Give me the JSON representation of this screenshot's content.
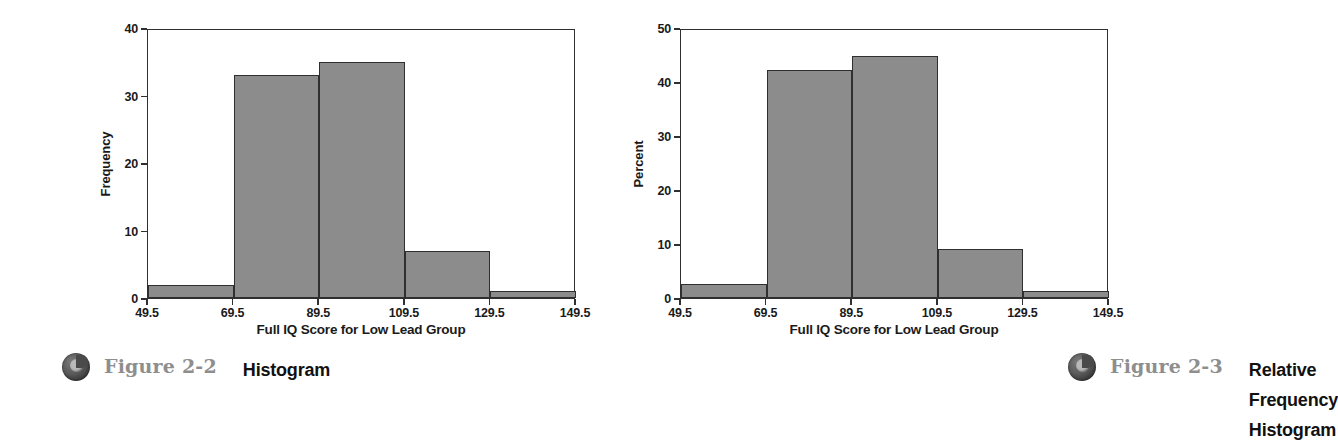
{
  "figures": [
    {
      "caption": {
        "icon": "sphere-bullet-icon",
        "number": "Figure 2-2",
        "title": "Histogram"
      },
      "chart_data": {
        "type": "bar",
        "title": "",
        "subtitle": "",
        "xlabel": "Full IQ Score for Low Lead Group",
        "ylabel": "Frequency",
        "grid": false,
        "legend": "none",
        "xlim": [
          49.5,
          149.5
        ],
        "ylim": [
          0,
          40
        ],
        "xticks": [
          "49.5",
          "69.5",
          "89.5",
          "109.5",
          "129.5",
          "149.5"
        ],
        "xtick_values": [
          49.5,
          69.5,
          89.5,
          109.5,
          129.5,
          149.5
        ],
        "yticks": [
          "0",
          "10",
          "20",
          "30",
          "40"
        ],
        "ytick_values": [
          0,
          10,
          20,
          30,
          40
        ],
        "bin_edges": [
          49.5,
          69.5,
          89.5,
          109.5,
          129.5,
          149.5
        ],
        "categories": [
          "49.5-69.5",
          "69.5-89.5",
          "89.5-109.5",
          "109.5-129.5",
          "129.5-149.5"
        ],
        "values": [
          2,
          33,
          35,
          7,
          1
        ],
        "bar_fill": "#8c8c8c",
        "bar_stroke": "#2f2f2f"
      }
    },
    {
      "caption": {
        "icon": "sphere-bullet-icon",
        "number": "Figure 2-3",
        "title": "Relative Frequency Histogram"
      },
      "chart_data": {
        "type": "bar",
        "title": "",
        "subtitle": "",
        "xlabel": "Full IQ Score for Low Lead Group",
        "ylabel": "Percent",
        "grid": false,
        "legend": "none",
        "xlim": [
          49.5,
          149.5
        ],
        "ylim": [
          0,
          50
        ],
        "xticks": [
          "49.5",
          "69.5",
          "89.5",
          "109.5",
          "129.5",
          "149.5"
        ],
        "xtick_values": [
          49.5,
          69.5,
          89.5,
          109.5,
          129.5,
          149.5
        ],
        "yticks": [
          "0",
          "10",
          "20",
          "30",
          "40",
          "50"
        ],
        "ytick_values": [
          0,
          10,
          20,
          30,
          40,
          50
        ],
        "bin_edges": [
          49.5,
          69.5,
          89.5,
          109.5,
          129.5,
          149.5
        ],
        "categories": [
          "49.5-69.5",
          "69.5-89.5",
          "89.5-109.5",
          "109.5-129.5",
          "129.5-149.5"
        ],
        "values": [
          2.6,
          42.3,
          44.9,
          9.0,
          1.3
        ],
        "bar_fill": "#8c8c8c",
        "bar_stroke": "#2f2f2f"
      }
    }
  ]
}
